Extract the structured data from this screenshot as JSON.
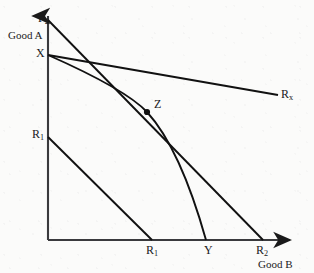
{
  "figure": {
    "background_color": "#fbfbfa",
    "ink_color": "#1a1a1a"
  },
  "axes": {
    "y_axis": {
      "name": "vertical-axis",
      "top_label": "P",
      "top_label_sub": "2",
      "quantity_label": "Good A",
      "origin_px": [
        48,
        240
      ],
      "tip_px": [
        48,
        14
      ]
    },
    "x_axis": {
      "name": "horizontal-axis",
      "quantity_label": "Good B",
      "origin_px": [
        48,
        240
      ],
      "tip_px": [
        292,
        240
      ]
    }
  },
  "points": {
    "X": {
      "label": "X",
      "axis": "y",
      "px": [
        48,
        55
      ]
    },
    "P2": {
      "label": "P",
      "sub": "2",
      "axis": "y",
      "px": [
        48,
        20
      ]
    },
    "R1_y": {
      "label": "R",
      "sub": "1",
      "axis": "y",
      "px": [
        48,
        137
      ]
    },
    "R1_x": {
      "label": "R",
      "sub": "1",
      "axis": "x",
      "px": [
        152,
        240
      ]
    },
    "Y": {
      "label": "Y",
      "axis": "x",
      "px": [
        208,
        240
      ]
    },
    "R2": {
      "label": "R",
      "sub": "2",
      "axis": "x",
      "px": [
        263,
        240
      ]
    },
    "Z": {
      "label": "Z",
      "type": "tangency-point",
      "px": [
        147,
        112
      ]
    },
    "Rx": {
      "label": "R",
      "sub": "x",
      "type": "line-endpoint",
      "px": [
        278,
        95
      ]
    }
  },
  "curves": [
    {
      "name": "budget-line-P2-R2",
      "kind": "straight",
      "from": [
        48,
        20
      ],
      "to": [
        263,
        240
      ],
      "label": ""
    },
    {
      "name": "budget-line-X-Rx",
      "kind": "straight",
      "from": [
        48,
        55
      ],
      "to": [
        278,
        95
      ],
      "label": "R",
      "label_sub": "x"
    },
    {
      "name": "transformation-curve-X-Z-Y",
      "kind": "curved",
      "from": [
        48,
        55
      ],
      "through": [
        147,
        112
      ],
      "to": [
        208,
        240
      ],
      "label": ""
    },
    {
      "name": "budget-line-R1-R1",
      "kind": "straight",
      "from": [
        48,
        137
      ],
      "to": [
        152,
        240
      ],
      "label": ""
    }
  ],
  "labels": {
    "p2": "P",
    "p2_sub": "2",
    "good_a": "Good A",
    "x": "X",
    "r1_y": "R",
    "r1_y_sub": "1",
    "r1_x": "R",
    "r1_x_sub": "1",
    "y": "Y",
    "r2": "R",
    "r2_sub": "2",
    "good_b": "Good B",
    "z": "Z",
    "rx": "R",
    "rx_sub": "x"
  }
}
